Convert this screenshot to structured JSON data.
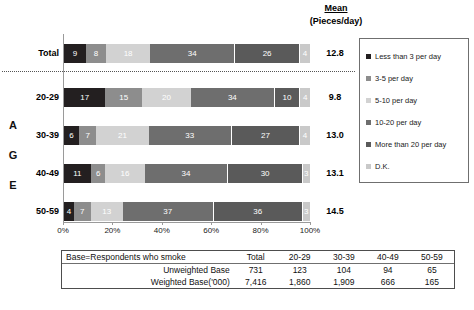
{
  "header": {
    "mean_word": "Mean",
    "mean_sub": "(Pieces/day)"
  },
  "age_axis_letters": [
    "A",
    "G",
    "E"
  ],
  "legend": {
    "items": [
      {
        "label": "Less than 3 per day",
        "color": "#231f20"
      },
      {
        "label": "3-5 per day",
        "color": "#8d8d8d"
      },
      {
        "label": "5-10 per day",
        "color": "#d2d2d2"
      },
      {
        "label": "10-20 per day",
        "color": "#6e6e6e"
      },
      {
        "label": "More than 20 per day",
        "color": "#5a5a5a"
      },
      {
        "label": "D.K.",
        "color": "#c9c9c9"
      }
    ]
  },
  "axis": {
    "ticks": [
      "0%",
      "20%",
      "40%",
      "60%",
      "80%",
      "100%"
    ]
  },
  "rows": [
    {
      "label": "Total",
      "mean": "12.8",
      "values": [
        9,
        8,
        18,
        34,
        26,
        4
      ],
      "labels": [
        "9",
        "8",
        "18",
        "34",
        "26",
        "4"
      ]
    },
    {
      "label": "20-29",
      "mean": "9.8",
      "values": [
        17,
        15,
        20,
        34,
        10,
        4
      ],
      "labels": [
        "17",
        "15",
        "20",
        "34",
        "10",
        "4"
      ]
    },
    {
      "label": "30-39",
      "mean": "13.0",
      "values": [
        6,
        7,
        21,
        33,
        27,
        4
      ],
      "labels": [
        "6",
        "7",
        "21",
        "33",
        "27",
        "4"
      ]
    },
    {
      "label": "40-49",
      "mean": "13.1",
      "values": [
        11,
        6,
        16,
        34,
        30,
        3
      ],
      "labels": [
        "11",
        "6",
        "16",
        "34",
        "30",
        "3"
      ]
    },
    {
      "label": "50-59",
      "mean": "14.5",
      "values": [
        4,
        7,
        13,
        37,
        36,
        3
      ],
      "labels": [
        "4",
        "7",
        "13",
        "37",
        "36",
        "3"
      ]
    }
  ],
  "base_table": {
    "header": [
      "Base=Respondents who smoke",
      "Total",
      "20-29",
      "30-39",
      "40-49",
      "50-59"
    ],
    "rows": [
      {
        "label": "Unweighted Base",
        "values": [
          "731",
          "123",
          "104",
          "94",
          "65"
        ]
      },
      {
        "label": "Weighted Base('000)",
        "values": [
          "7,416",
          "1,860",
          "1,909",
          "666",
          "165"
        ]
      }
    ]
  },
  "chart_data": {
    "type": "bar",
    "orientation": "horizontal",
    "stacked": true,
    "stack_unit": "percent",
    "title": "",
    "xlabel": "",
    "ylabel": "AGE",
    "xlim": [
      0,
      100
    ],
    "grid": false,
    "legend_position": "right",
    "categories": [
      "Total",
      "20-29",
      "30-39",
      "40-49",
      "50-59"
    ],
    "series": [
      {
        "name": "Less than 3 per day",
        "values": [
          9,
          17,
          6,
          11,
          4
        ],
        "color": "#231f20"
      },
      {
        "name": "3-5 per day",
        "values": [
          8,
          15,
          7,
          6,
          7
        ],
        "color": "#8d8d8d"
      },
      {
        "name": "5-10 per day",
        "values": [
          18,
          20,
          21,
          16,
          13
        ],
        "color": "#d2d2d2"
      },
      {
        "name": "10-20 per day",
        "values": [
          34,
          34,
          33,
          34,
          37
        ],
        "color": "#6e6e6e"
      },
      {
        "name": "More than 20 per day",
        "values": [
          26,
          10,
          27,
          30,
          36
        ],
        "color": "#5a5a5a"
      },
      {
        "name": "D.K.",
        "values": [
          4,
          4,
          4,
          3,
          3
        ],
        "color": "#c9c9c9"
      }
    ],
    "annotations": {
      "mean_header": "Mean (Pieces/day)",
      "mean_values": [
        "12.8",
        "9.8",
        "13.0",
        "13.1",
        "14.5"
      ]
    },
    "tick_labels": [
      "0%",
      "20%",
      "40%",
      "60%",
      "80%",
      "100%"
    ],
    "base_table": {
      "columns": [
        "Base=Respondents who smoke",
        "Total",
        "20-29",
        "30-39",
        "40-49",
        "50-59"
      ],
      "unweighted_base": [
        731,
        123,
        104,
        94,
        65
      ],
      "weighted_base_000": [
        "7,416",
        "1,860",
        "1,909",
        "666",
        "165"
      ]
    }
  }
}
